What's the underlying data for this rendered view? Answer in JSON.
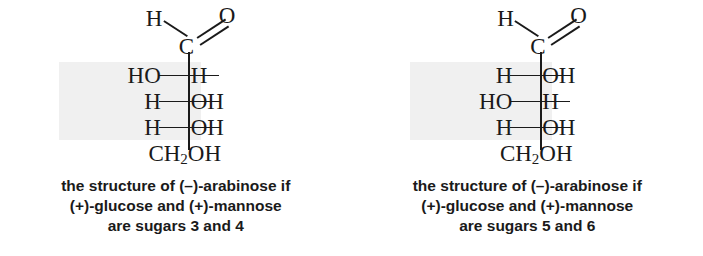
{
  "figure": {
    "shade_color": "#f0f0f0",
    "ink_color": "#1a1a1a",
    "background": "#ffffff"
  },
  "structures": [
    {
      "id": "arabinose-left",
      "top_h": "H",
      "top_c": "C",
      "top_o": "O",
      "tail_text": "CH",
      "tail_sub": "2",
      "tail_rest": "OH",
      "rows": [
        {
          "left": "HO",
          "right": "H"
        },
        {
          "left": "H",
          "right": "OH"
        },
        {
          "left": "H",
          "right": "OH"
        }
      ],
      "caption": {
        "line1": "the structure of (–)-arabinose if",
        "line2": "(+)-glucose and (+)-mannose",
        "line3": "are sugars 3 and 4"
      }
    },
    {
      "id": "arabinose-right",
      "top_h": "H",
      "top_c": "C",
      "top_o": "O",
      "tail_text": "CH",
      "tail_sub": "2",
      "tail_rest": "OH",
      "rows": [
        {
          "left": "H",
          "right": "OH"
        },
        {
          "left": "HO",
          "right": "H"
        },
        {
          "left": "H",
          "right": "OH"
        }
      ],
      "caption": {
        "line1": "the structure of (–)-arabinose if",
        "line2": "(+)-glucose and (+)-mannose",
        "line3": "are sugars 5 and 6"
      }
    }
  ]
}
